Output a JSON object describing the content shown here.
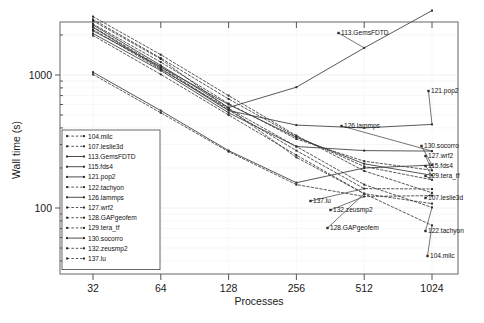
{
  "chart_data": {
    "type": "line",
    "title": "",
    "xlabel": "Processes",
    "ylabel": "Wall time (s)",
    "xscale": "log2",
    "yscale": "log10",
    "xticks": [
      32,
      64,
      128,
      256,
      512,
      1024
    ],
    "xtick_labels": [
      "32",
      "64",
      "128",
      "256",
      "512",
      "1024"
    ],
    "yticks": [
      100,
      1000
    ],
    "ytick_labels": [
      "100",
      "1000"
    ],
    "xlim": [
      24,
      1500
    ],
    "ylim": [
      60,
      4200
    ],
    "grid": true,
    "legend_position": "lower-left-inside",
    "x": [
      32,
      64,
      128,
      256,
      512,
      1024
    ],
    "series": [
      {
        "name": "104.milc",
        "style": "dashed",
        "values": [
          2550,
          1320,
          560,
          240,
          128,
          74
        ],
        "end_label": "104.milc"
      },
      {
        "name": "107.leslie3d",
        "style": "dashed",
        "values": [
          2750,
          1420,
          700,
          350,
          190,
          130
        ],
        "end_label": "107.leslie3d"
      },
      {
        "name": "113.GemsFDTD",
        "style": "solid",
        "values": [
          2380,
          1180,
          570,
          810,
          1600,
          3050
        ],
        "end_label": "113.GemsFDTD"
      },
      {
        "name": "115.fds4",
        "style": "solid",
        "values": [
          2150,
          1150,
          600,
          340,
          215,
          176
        ],
        "end_label": "115.fds4"
      },
      {
        "name": "121.pop2",
        "style": "solid",
        "values": [
          2280,
          1120,
          540,
          420,
          400,
          425
        ],
        "end_label": "121.pop2"
      },
      {
        "name": "122.tachyon",
        "style": "dashed",
        "values": [
          2200,
          1100,
          560,
          290,
          150,
          101
        ],
        "end_label": "122.tachyon"
      },
      {
        "name": "126.lammps",
        "style": "solid",
        "values": [
          2050,
          1080,
          520,
          290,
          270,
          268
        ],
        "end_label": "126.lammps"
      },
      {
        "name": "127.wrf2",
        "style": "dashed",
        "values": [
          2420,
          1250,
          610,
          330,
          225,
          192
        ],
        "end_label": "127.wrf2"
      },
      {
        "name": "128.GAPgeofem",
        "style": "dashed",
        "values": [
          1980,
          1010,
          500,
          250,
          128,
          108
        ],
        "end_label": "128.GAPgeofem"
      },
      {
        "name": "129.tera_tf",
        "style": "dashed",
        "values": [
          2620,
          1340,
          660,
          345,
          205,
          163
        ],
        "end_label": "129.tera_tf"
      },
      {
        "name": "130.socorro",
        "style": "solid",
        "values": [
          1050,
          540,
          270,
          155,
          200,
          210
        ],
        "end_label": "130.socorro"
      },
      {
        "name": "132.zeusmp2",
        "style": "dashed",
        "values": [
          1010,
          520,
          265,
          150,
          122,
          124
        ],
        "end_label": "132.zeusmp2"
      },
      {
        "name": "137.lu",
        "style": "dashed",
        "values": [
          2300,
          1150,
          545,
          270,
          140,
          139
        ],
        "end_label": "137.lu"
      }
    ],
    "annotations": [
      {
        "text": "113.GemsFDTD",
        "x": 341,
        "y": 35
      },
      {
        "text": "121.pop2",
        "x": 431,
        "y": 93
      },
      {
        "text": "126.lammps",
        "x": 344,
        "y": 128
      },
      {
        "text": "130.socorro",
        "x": 424,
        "y": 148
      },
      {
        "text": "127.wrf2",
        "x": 428,
        "y": 158
      },
      {
        "text": "115.fds4",
        "x": 428,
        "y": 168
      },
      {
        "text": "129.tera_tf",
        "x": 428,
        "y": 178
      },
      {
        "text": "107.leslie3d",
        "x": 428,
        "y": 200
      },
      {
        "text": "137.lu",
        "x": 313,
        "y": 203
      },
      {
        "text": "132.zeusmp2",
        "x": 333,
        "y": 212
      },
      {
        "text": "128.GAPgeofem",
        "x": 330,
        "y": 230
      },
      {
        "text": "122.tachyon",
        "x": 428,
        "y": 233
      },
      {
        "text": "104.milc",
        "x": 430,
        "y": 258
      }
    ],
    "legend_entries": [
      "104.milc",
      "107.leslie3d",
      "113.GemsFDTD",
      "115.fds4",
      "121.pop2",
      "122.tachyon",
      "126.lammps",
      "127.wrf2",
      "128.GAPgeofem",
      "129.tera_tf",
      "130.socorro",
      "132.zeusmp2",
      "137.lu"
    ]
  }
}
